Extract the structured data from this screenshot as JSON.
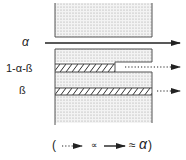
{
  "diagram": {
    "labels": {
      "alpha": "α",
      "one_minus_alpha_beta": "1-α-ß",
      "beta": "ß"
    },
    "legend": {
      "open_paren": "(",
      "proportional": "∝",
      "approx": "≈",
      "alpha": "α",
      "close_paren": ")",
      "dotted_arrow_icon": "dotted-arrow",
      "solid_arrow_icon": "solid-arrow"
    },
    "colors": {
      "line": "#333333",
      "fill_dots": "#9a9a9a",
      "background": "#ffffff"
    }
  }
}
